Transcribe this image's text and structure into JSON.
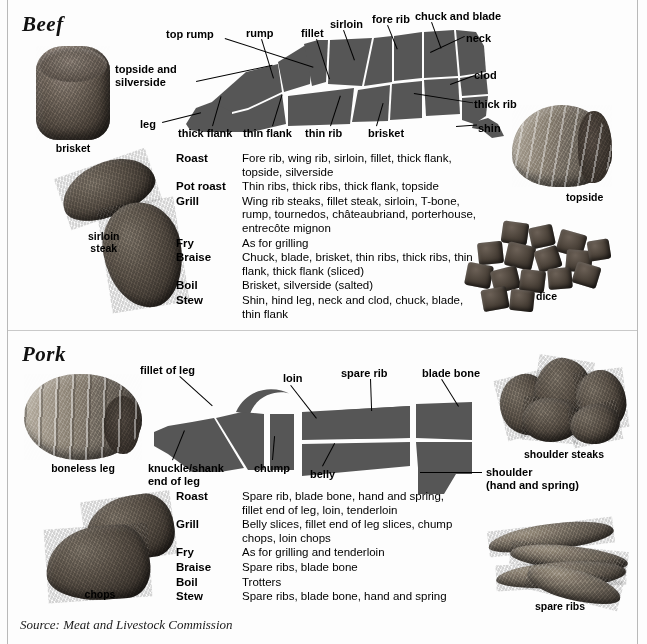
{
  "page": {
    "source_note": "Source: Meat and Livestock Commission",
    "diagram_fill": "#565656",
    "background": "#fdfdfd"
  },
  "beef": {
    "title": "Beef",
    "diagram_labels": [
      "top rump",
      "topside and silverside",
      "rump",
      "fillet",
      "sirloin",
      "fore rib",
      "chuck and blade",
      "neck",
      "clod",
      "thick rib",
      "shin",
      "brisket",
      "thin rib",
      "thin flank",
      "thick flank",
      "leg"
    ],
    "labels": {
      "top_rump": "top rump",
      "topside_silverside_l1": "topside and",
      "topside_silverside_l2": "silverside",
      "rump": "rump",
      "fillet": "fillet",
      "sirloin": "sirloin",
      "fore_rib": "fore rib",
      "chuck_blade": "chuck and blade",
      "neck": "neck",
      "clod": "clod",
      "thick_rib": "thick rib",
      "shin": "shin",
      "brisket": "brisket",
      "thin_rib": "thin rib",
      "thin_flank": "thin flank",
      "thick_flank": "thick flank",
      "leg": "leg"
    },
    "photos": [
      {
        "caption": "brisket"
      },
      {
        "caption": "sirloin steak"
      },
      {
        "caption": "topside"
      },
      {
        "caption": "dice"
      }
    ],
    "photo_captions": {
      "brisket": "brisket",
      "sirloin_steak_l1": "sirloin",
      "sirloin_steak_l2": "steak",
      "topside": "topside",
      "dice": "dice"
    },
    "methods": [
      {
        "name": "Roast",
        "desc": "Fore rib, wing rib, sirloin, fillet, thick flank, topside, silverside"
      },
      {
        "name": "Pot roast",
        "desc": "Thin ribs, thick ribs, thick flank, topside"
      },
      {
        "name": "Grill",
        "desc": "Wing rib steaks, fillet steak, sirloin, T-bone, rump, tournedos, châteaubriand, porterhouse, entrecôte mignon"
      },
      {
        "name": "Fry",
        "desc": "As for grilling"
      },
      {
        "name": "Braise",
        "desc": "Chuck, blade, brisket, thin ribs, thick ribs, thin flank, thick flank (sliced)"
      },
      {
        "name": "Boil",
        "desc": "Brisket, silverside (salted)"
      },
      {
        "name": "Stew",
        "desc": "Shin, hind leg, neck and clod, chuck, blade, thin flank"
      }
    ]
  },
  "pork": {
    "title": "Pork",
    "diagram_labels": [
      "fillet of leg",
      "loin",
      "spare rib",
      "blade bone",
      "knuckle/shank end of leg",
      "chump",
      "belly",
      "shoulder (hand and spring)"
    ],
    "labels": {
      "fillet_of_leg": "fillet of leg",
      "loin": "loin",
      "spare_rib": "spare rib",
      "blade_bone": "blade bone",
      "knuckle_l1": "knuckle/shank",
      "knuckle_l2": "end of leg",
      "chump": "chump",
      "belly": "belly",
      "shoulder_l1": "shoulder",
      "shoulder_l2": "(hand and spring)"
    },
    "photos": [
      {
        "caption": "boneless leg"
      },
      {
        "caption": "chops"
      },
      {
        "caption": "shoulder steaks"
      },
      {
        "caption": "spare ribs"
      }
    ],
    "photo_captions": {
      "boneless_leg": "boneless leg",
      "chops": "chops",
      "shoulder_steaks": "shoulder steaks",
      "spare_ribs": "spare ribs"
    },
    "methods": [
      {
        "name": "Roast",
        "desc": "Spare rib, blade bone, hand and spring, fillet end of leg, loin, tenderloin"
      },
      {
        "name": "Grill",
        "desc": "Belly slices, fillet end of leg slices, chump chops, loin chops"
      },
      {
        "name": "Fry",
        "desc": "As for grilling and tenderloin"
      },
      {
        "name": "Braise",
        "desc": "Spare ribs, blade bone"
      },
      {
        "name": "Boil",
        "desc": "Trotters"
      },
      {
        "name": "Stew",
        "desc": "Spare ribs, blade bone, hand and spring"
      }
    ]
  }
}
